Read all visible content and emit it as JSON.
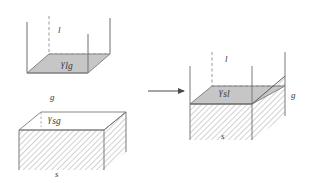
{
  "figure": {
    "type": "thermodynamic-wetting-diagram",
    "background_color": "#ffffff",
    "stroke_color": "#6a6a6a",
    "text_color": "#3a3a3a",
    "liquid_fill_color": "#c6c6c6",
    "hatch_color": "#8c8c8c",
    "white_fill_color": "#ffffff"
  },
  "panels": {
    "liquid_container": {
      "name": "liquid-container-panel",
      "phase_label": "l",
      "surface_tension": {
        "symbol": "γ",
        "subscript": "lg"
      }
    },
    "solid_substrate": {
      "name": "solid-substrate-panel",
      "gas_label": "g",
      "solid_label": "s",
      "surface_tension": {
        "symbol": "γ",
        "subscript": "sg"
      }
    },
    "combined_result": {
      "name": "combined-wetting-panel",
      "liquid_label": "l",
      "gas_label": "g",
      "solid_label": "s",
      "surface_tension": {
        "symbol": "γ",
        "subscript": "sl"
      }
    }
  },
  "arrow": {
    "name": "transition-arrow",
    "direction": "right"
  }
}
